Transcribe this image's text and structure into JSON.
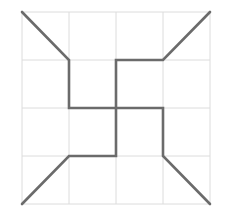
{
  "diagram": {
    "type": "grid-figure",
    "background": "#ffffff",
    "grid": {
      "color": "#dcdcdc",
      "x_lines": [
        22,
        69,
        116,
        163,
        210
      ],
      "y_lines": [
        12,
        60,
        108,
        156,
        204
      ]
    },
    "figure": {
      "stroke": "#6b6b6b",
      "stroke_width": 2.6,
      "segments": [
        {
          "name": "arm-top-left",
          "points": [
            [
              22,
              12
            ],
            [
              69,
              60
            ],
            [
              69,
              108
            ],
            [
              116,
              108
            ]
          ]
        },
        {
          "name": "arm-top-right",
          "points": [
            [
              210,
              12
            ],
            [
              163,
              60
            ],
            [
              116,
              60
            ],
            [
              116,
              108
            ]
          ]
        },
        {
          "name": "arm-bottom-right",
          "points": [
            [
              210,
              204
            ],
            [
              163,
              156
            ],
            [
              163,
              108
            ],
            [
              116,
              108
            ]
          ]
        },
        {
          "name": "arm-bottom-left",
          "points": [
            [
              22,
              204
            ],
            [
              69,
              156
            ],
            [
              116,
              156
            ],
            [
              116,
              108
            ]
          ]
        }
      ]
    }
  }
}
